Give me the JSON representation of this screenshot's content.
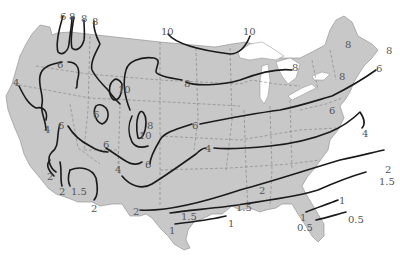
{
  "map": {
    "region": "Contiguous United States",
    "type": "isoline map",
    "colors": {
      "land": "#c8c8c8",
      "isoline": "#1a1a1a",
      "label": "#555555",
      "background": "#ffffff"
    },
    "labels": [
      {
        "text": "6",
        "x": 60,
        "y": 12
      },
      {
        "text": "8",
        "x": 69,
        "y": 12
      },
      {
        "text": "8",
        "x": 81,
        "y": 14
      },
      {
        "text": "8",
        "x": 92,
        "y": 17
      },
      {
        "text": "10",
        "x": 161,
        "y": 27
      },
      {
        "text": "10",
        "x": 243,
        "y": 27
      },
      {
        "text": "6",
        "x": 57,
        "y": 60
      },
      {
        "text": "4",
        "x": 13,
        "y": 78
      },
      {
        "text": "8",
        "x": 184,
        "y": 79
      },
      {
        "text": "8",
        "x": 292,
        "y": 63
      },
      {
        "text": "8",
        "x": 345,
        "y": 40
      },
      {
        "text": "8",
        "x": 386,
        "y": 46
      },
      {
        "text": "8",
        "x": 339,
        "y": 72
      },
      {
        "text": "6",
        "x": 376,
        "y": 64
      },
      {
        "text": "10",
        "x": 118,
        "y": 85
      },
      {
        "text": "6",
        "x": 93,
        "y": 110
      },
      {
        "text": "4",
        "x": 44,
        "y": 125
      },
      {
        "text": "6",
        "x": 58,
        "y": 121
      },
      {
        "text": "8",
        "x": 147,
        "y": 121
      },
      {
        "text": "10",
        "x": 139,
        "y": 131
      },
      {
        "text": "6",
        "x": 192,
        "y": 121
      },
      {
        "text": "6",
        "x": 103,
        "y": 140
      },
      {
        "text": "6",
        "x": 145,
        "y": 160
      },
      {
        "text": "6",
        "x": 329,
        "y": 106
      },
      {
        "text": "4",
        "x": 115,
        "y": 165
      },
      {
        "text": "4",
        "x": 205,
        "y": 144
      },
      {
        "text": "4",
        "x": 362,
        "y": 129
      },
      {
        "text": "2",
        "x": 47,
        "y": 172
      },
      {
        "text": "2",
        "x": 59,
        "y": 187
      },
      {
        "text": "1.5",
        "x": 71,
        "y": 187
      },
      {
        "text": "2",
        "x": 91,
        "y": 204
      },
      {
        "text": "2",
        "x": 385,
        "y": 165
      },
      {
        "text": "2",
        "x": 133,
        "y": 207
      },
      {
        "text": "2",
        "x": 259,
        "y": 186
      },
      {
        "text": "1.5",
        "x": 379,
        "y": 177
      },
      {
        "text": "1.5",
        "x": 181,
        "y": 212
      },
      {
        "text": "1.5",
        "x": 236,
        "y": 203
      },
      {
        "text": "1",
        "x": 169,
        "y": 226
      },
      {
        "text": "1",
        "x": 228,
        "y": 219
      },
      {
        "text": "1",
        "x": 300,
        "y": 213
      },
      {
        "text": "1",
        "x": 339,
        "y": 196
      },
      {
        "text": "0.5",
        "x": 348,
        "y": 215
      },
      {
        "text": "0.5",
        "x": 297,
        "y": 223
      }
    ]
  }
}
